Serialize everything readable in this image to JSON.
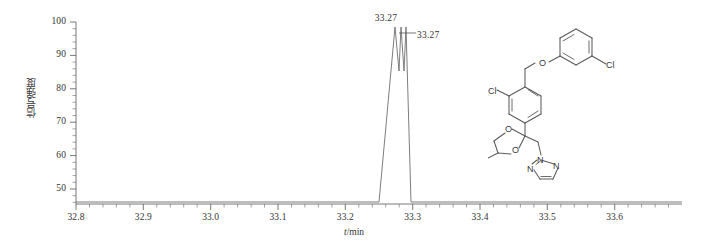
{
  "figure": {
    "background_color": "#ffffff",
    "line_color": "#6e6e6e",
    "axis_color": "#555555",
    "text_color": "#333333"
  },
  "chart_data": {
    "type": "line",
    "title": "",
    "subtitle": "",
    "xlabel": "t/min",
    "ylabel": "信号强度",
    "xlim": [
      32.76,
      33.66
    ],
    "ylim": [
      43,
      101
    ],
    "grid": false,
    "legend": null,
    "xticks": [
      32.8,
      32.9,
      33.0,
      33.1,
      33.2,
      33.3,
      33.4,
      33.5,
      33.6
    ],
    "xtick_labels": [
      "32.8",
      "32.9",
      "33.0",
      "33.1",
      "33.2",
      "33.3",
      "33.4",
      "33.5",
      "33.6"
    ],
    "x_minor_ticks_per_interval": 5,
    "yticks": [
      50,
      60,
      70,
      80,
      90,
      100
    ],
    "ytick_labels": [
      "50",
      "60",
      "70",
      "80",
      "90",
      "100"
    ],
    "y_minor_ticks_per_interval": 5,
    "series": [
      {
        "name": "chromatogram",
        "color": "#6e6e6e",
        "x": [
          32.76,
          33.228,
          33.252,
          33.262,
          33.2665,
          33.27,
          33.2735,
          33.278,
          33.284,
          33.3,
          33.66
        ],
        "y": [
          43.5,
          43.5,
          58,
          82,
          99.5,
          86,
          99.2,
          82,
          58,
          43.5,
          43.5
        ]
      }
    ],
    "annotations": [
      {
        "name": "peak-apex-label",
        "text": "33.27",
        "x": 33.266,
        "y": 104,
        "leader": false
      },
      {
        "name": "peak-second-label",
        "text": "33.27",
        "x": 33.311,
        "y": 97,
        "leader": true,
        "leader_from_x": 33.2735,
        "leader_from_y": 97
      }
    ],
    "peaks": [
      {
        "retention_time": "33.27",
        "relative_intensity": 100
      },
      {
        "retention_time": "33.27",
        "relative_intensity": 99
      }
    ]
  },
  "molecule": {
    "name": "difenoconazole-structure",
    "atom_labels": [
      {
        "id": "cl-left",
        "text": "Cl"
      },
      {
        "id": "o-ether",
        "text": "O"
      },
      {
        "id": "cl-right",
        "text": "Cl"
      },
      {
        "id": "o-dioxolane-top",
        "text": "O"
      },
      {
        "id": "o-dioxolane-bottom",
        "text": "O"
      },
      {
        "id": "n1-triazole",
        "text": "N"
      },
      {
        "id": "n2-triazole",
        "text": "N"
      },
      {
        "id": "n4-triazole",
        "text": "N"
      }
    ]
  }
}
